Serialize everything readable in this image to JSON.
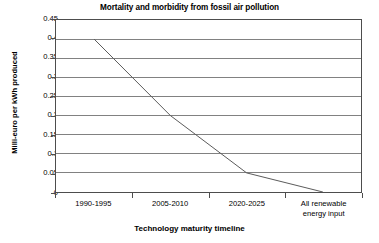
{
  "chart_data": {
    "type": "line",
    "title": "Mortality and morbidity from fossil air pollution",
    "xlabel": "Technology maturity timeline",
    "ylabel": "Milli-euro per kWh produced",
    "categories": [
      "1990-1995",
      "2005-2010",
      "2020-2025",
      "All renewable\nenergy input"
    ],
    "values": [
      0.4,
      0.2,
      0.05,
      0
    ],
    "series": [
      {
        "name": "Mortality and morbidity cost",
        "values": [
          0.4,
          0.2,
          0.05,
          0
        ]
      }
    ],
    "ylim": [
      0,
      0.45
    ],
    "ytick_labels": [
      "0.45",
      "0.4",
      "0.35",
      "0.3",
      "0.25",
      "0.2",
      "0.15",
      "0.1",
      "0.05",
      "0"
    ],
    "ytick_values": [
      0.45,
      0.4,
      0.35,
      0.3,
      0.25,
      0.2,
      0.15,
      0.1,
      0.05,
      0
    ],
    "grid": true,
    "grid_axis": "y",
    "legend": false,
    "legend_position": "none",
    "line_color": "#595959",
    "grid_color": "#808080",
    "axis_color": "#4d4d4d",
    "background_color": "#ffffff"
  }
}
